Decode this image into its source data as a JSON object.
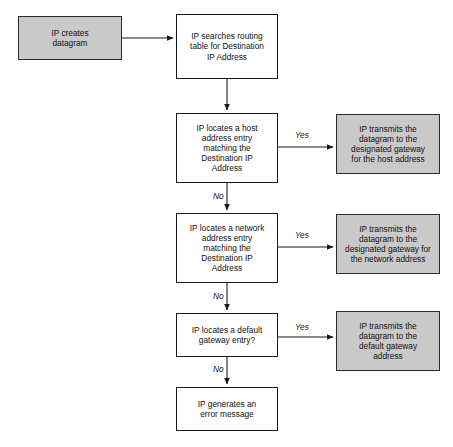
{
  "diagram": {
    "canvas": {
      "width": 453,
      "height": 447
    },
    "colors": {
      "terminal_fill": "#c9c9c9",
      "process_fill": "#ffffff",
      "stroke": "#1a1a1a",
      "text": "#111111",
      "background": "#ffffff"
    },
    "nodes": [
      {
        "id": "create-datagram",
        "label": "IP creates\ndatagram",
        "type": "terminal",
        "x": 18,
        "y": 16,
        "w": 104,
        "h": 44
      },
      {
        "id": "search-routing-table",
        "label": "IP searches routing\ntable for Destination\nIP Address",
        "type": "process",
        "x": 176,
        "y": 14,
        "w": 102,
        "h": 65
      },
      {
        "id": "locate-host-entry",
        "label": "IP locates a host\naddress entry\nmatching the\nDestination IP\nAddress",
        "type": "process",
        "x": 176,
        "y": 113,
        "w": 102,
        "h": 70
      },
      {
        "id": "transmit-host-gateway",
        "label": "IP transmits the\ndatagram to the\ndesignated gateway\nfor the host address",
        "type": "terminal",
        "x": 336,
        "y": 114,
        "w": 104,
        "h": 60
      },
      {
        "id": "locate-network-entry",
        "label": "IP locates a network\naddress entry\nmatching the\nDestination IP\nAddress",
        "type": "process",
        "x": 176,
        "y": 213,
        "w": 102,
        "h": 70
      },
      {
        "id": "transmit-network-gateway",
        "label": "IP transmits the\ndatagram to the\ndesignated gateway for\nthe network address",
        "type": "terminal",
        "x": 336,
        "y": 214,
        "w": 104,
        "h": 60
      },
      {
        "id": "locate-default-gateway",
        "label": "IP locates a default\ngateway entry?",
        "type": "process",
        "x": 176,
        "y": 313,
        "w": 102,
        "h": 44
      },
      {
        "id": "transmit-default-gateway",
        "label": "IP transmits the\ndatagram to the\ndefault gateway\naddress",
        "type": "terminal",
        "x": 336,
        "y": 311,
        "w": 104,
        "h": 60
      },
      {
        "id": "error-message",
        "label": "IP generates an\nerror message",
        "type": "process",
        "x": 176,
        "y": 387,
        "w": 102,
        "h": 44
      }
    ],
    "edge_labels": [
      {
        "id": "yes-host",
        "text": "Yes",
        "x": 295,
        "y": 130
      },
      {
        "id": "no-host",
        "text": "No",
        "x": 213,
        "y": 191
      },
      {
        "id": "yes-network",
        "text": "Yes",
        "x": 295,
        "y": 230
      },
      {
        "id": "no-network",
        "text": "No",
        "x": 213,
        "y": 291
      },
      {
        "id": "yes-default",
        "text": "Yes",
        "x": 295,
        "y": 322
      },
      {
        "id": "no-default",
        "text": "No",
        "x": 213,
        "y": 364
      }
    ]
  }
}
